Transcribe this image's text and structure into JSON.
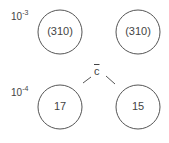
{
  "diagram": {
    "row_labels": [
      {
        "base": "10",
        "exponent": "-3"
      },
      {
        "base": "10",
        "exponent": "-4"
      }
    ],
    "nodes": [
      {
        "label": "(310)",
        "cx": 60,
        "cy": 32,
        "r": 22
      },
      {
        "label": "(310)",
        "cx": 138,
        "cy": 32,
        "r": 22
      },
      {
        "label": "17",
        "cx": 60,
        "cy": 107,
        "r": 22
      },
      {
        "label": "15",
        "cx": 138,
        "cy": 107,
        "r": 22
      }
    ],
    "connector_label": "c",
    "stroke_color": "#555555"
  }
}
